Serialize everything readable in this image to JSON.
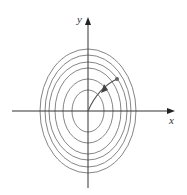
{
  "figure": {
    "axes": {
      "x_label": "x",
      "y_label": "y",
      "origin_px": [
        88,
        111
      ],
      "x_range_px": [
        12,
        175
      ],
      "y_range_px": [
        18,
        188
      ],
      "color": "#333333"
    },
    "level_curves": {
      "color": "#777777",
      "count": 6,
      "ellipses": [
        {
          "rx": 16,
          "ry": 21
        },
        {
          "rx": 25,
          "ry": 32
        },
        {
          "rx": 33,
          "ry": 43
        },
        {
          "rx": 39,
          "ry": 49
        },
        {
          "rx": 43,
          "ry": 56
        },
        {
          "rx": 48,
          "ry": 62
        }
      ]
    },
    "path": {
      "color": "#555555",
      "start_px": [
        117,
        79
      ],
      "end_px": [
        88,
        111
      ],
      "arrow_at_px": [
        104,
        89
      ]
    }
  }
}
